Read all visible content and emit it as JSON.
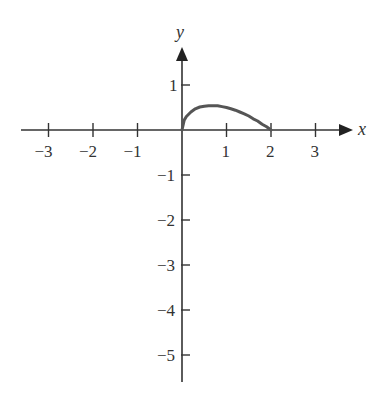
{
  "chart_data": {
    "type": "line",
    "title": "",
    "xlabel": "x",
    "ylabel": "y",
    "xlim": [
      -3.7,
      3.7
    ],
    "ylim": [
      -5.6,
      1.8
    ],
    "grid": false,
    "x_ticks": [
      -3,
      -2,
      -1,
      1,
      2,
      3
    ],
    "x_tick_labels": [
      "−3",
      "−2",
      "−1",
      "1",
      "2",
      "3"
    ],
    "y_ticks": [
      1,
      -1,
      -2,
      -3,
      -4,
      -5
    ],
    "y_tick_labels": [
      "1",
      "−1",
      "−2",
      "−3",
      "−4",
      "−5"
    ],
    "series": [
      {
        "name": "curve",
        "x": [
          0,
          0.05,
          0.1,
          0.2,
          0.3,
          0.4,
          0.5,
          0.6,
          0.7,
          0.8,
          0.9,
          1.0,
          1.1,
          1.2,
          1.3,
          1.4,
          1.5,
          1.6,
          1.7,
          1.8,
          1.9,
          2.0
        ],
        "y": [
          0,
          0.22,
          0.3,
          0.4,
          0.47,
          0.51,
          0.53,
          0.54,
          0.54,
          0.54,
          0.52,
          0.5,
          0.47,
          0.44,
          0.4,
          0.36,
          0.31,
          0.25,
          0.2,
          0.13,
          0.07,
          0
        ]
      }
    ]
  },
  "colors": {
    "axis": "#333333",
    "curve": "#555555"
  }
}
